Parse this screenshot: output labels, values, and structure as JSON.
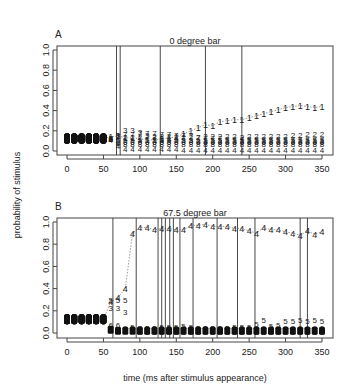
{
  "figure": {
    "ylabel": "probability of stimulus",
    "xlabel": "time (ms after stimulus appearance)"
  },
  "panels": [
    {
      "letter": "A",
      "title": "0 degree bar"
    },
    {
      "letter": "B",
      "title": "67.5 degree bar"
    }
  ],
  "chart_data": [
    {
      "type": "scatter",
      "panel": "A",
      "title": "0 degree bar",
      "xlabel": "time (ms after stimulus appearance)",
      "ylabel": "probability of stimulus",
      "xlim": [
        -10,
        360
      ],
      "ylim": [
        0,
        1.0
      ],
      "xticks": [
        0,
        50,
        100,
        150,
        200,
        250,
        300,
        350
      ],
      "yticks": [
        0.0,
        0.2,
        0.4,
        0.6,
        0.8,
        1.0
      ],
      "vertical_lines_ms": [
        68,
        73,
        128,
        190,
        240
      ],
      "x": [
        0,
        10,
        20,
        30,
        40,
        50,
        60,
        70,
        80,
        90,
        100,
        110,
        120,
        130,
        140,
        150,
        160,
        170,
        180,
        190,
        200,
        210,
        220,
        230,
        240,
        250,
        260,
        270,
        280,
        290,
        300,
        310,
        320,
        330,
        340,
        350
      ],
      "series": [
        {
          "name": "1",
          "values": [
            0.125,
            0.125,
            0.125,
            0.125,
            0.125,
            0.125,
            0.14,
            0.15,
            0.13,
            0.13,
            0.12,
            0.11,
            0.11,
            0.12,
            0.13,
            0.14,
            0.17,
            0.2,
            0.23,
            0.26,
            0.25,
            0.29,
            0.3,
            0.31,
            0.31,
            0.33,
            0.35,
            0.37,
            0.39,
            0.41,
            0.43,
            0.44,
            0.45,
            0.44,
            0.43,
            0.44
          ]
        },
        {
          "name": "2",
          "values": [
            0.125,
            0.125,
            0.125,
            0.125,
            0.125,
            0.125,
            0.12,
            0.14,
            0.14,
            0.14,
            0.14,
            0.15,
            0.15,
            0.15,
            0.15,
            0.14,
            0.14,
            0.14,
            0.14,
            0.15,
            0.15,
            0.15,
            0.15,
            0.15,
            0.14,
            0.15,
            0.15,
            0.15,
            0.15,
            0.15,
            0.15,
            0.16,
            0.16,
            0.17,
            0.17,
            0.17
          ]
        },
        {
          "name": "3",
          "values": [
            0.125,
            0.125,
            0.125,
            0.125,
            0.125,
            0.125,
            0.13,
            0.16,
            0.21,
            0.21,
            0.19,
            0.16,
            0.14,
            0.13,
            0.12,
            0.12,
            0.11,
            0.11,
            0.1,
            0.1,
            0.1,
            0.1,
            0.1,
            0.1,
            0.1,
            0.1,
            0.1,
            0.1,
            0.1,
            0.1,
            0.1,
            0.1,
            0.1,
            0.1,
            0.1,
            0.1
          ]
        },
        {
          "name": "4",
          "values": [
            0.125,
            0.125,
            0.125,
            0.125,
            0.125,
            0.125,
            0.11,
            0.05,
            0.02,
            0.02,
            0.02,
            0.02,
            0.02,
            0.02,
            0.02,
            0.02,
            0.01,
            0.01,
            0.01,
            0.01,
            0.01,
            0.01,
            0.01,
            0.01,
            0.01,
            0.01,
            0.01,
            0.01,
            0.01,
            0.01,
            0.01,
            0.01,
            0.01,
            0.01,
            0.01,
            0.01
          ]
        },
        {
          "name": "5",
          "values": [
            0.125,
            0.125,
            0.125,
            0.125,
            0.125,
            0.125,
            0.12,
            0.11,
            0.11,
            0.11,
            0.11,
            0.11,
            0.11,
            0.11,
            0.11,
            0.11,
            0.11,
            0.11,
            0.11,
            0.11,
            0.11,
            0.11,
            0.11,
            0.11,
            0.11,
            0.11,
            0.11,
            0.11,
            0.11,
            0.11,
            0.11,
            0.11,
            0.11,
            0.11,
            0.11,
            0.11
          ]
        },
        {
          "name": "6",
          "values": [
            0.125,
            0.125,
            0.125,
            0.125,
            0.125,
            0.125,
            0.12,
            0.09,
            0.09,
            0.09,
            0.09,
            0.09,
            0.09,
            0.09,
            0.09,
            0.09,
            0.09,
            0.09,
            0.09,
            0.09,
            0.09,
            0.09,
            0.09,
            0.09,
            0.09,
            0.09,
            0.09,
            0.09,
            0.09,
            0.09,
            0.09,
            0.09,
            0.09,
            0.09,
            0.09,
            0.09
          ]
        },
        {
          "name": "7",
          "values": [
            0.125,
            0.125,
            0.125,
            0.125,
            0.125,
            0.125,
            0.13,
            0.15,
            0.17,
            0.17,
            0.18,
            0.18,
            0.18,
            0.17,
            0.17,
            0.16,
            0.16,
            0.15,
            0.14,
            0.13,
            0.13,
            0.13,
            0.12,
            0.12,
            0.12,
            0.12,
            0.12,
            0.12,
            0.12,
            0.12,
            0.12,
            0.12,
            0.12,
            0.12,
            0.12,
            0.12
          ]
        },
        {
          "name": "8",
          "values": [
            0.125,
            0.125,
            0.125,
            0.125,
            0.125,
            0.125,
            0.12,
            0.08,
            0.07,
            0.07,
            0.07,
            0.07,
            0.07,
            0.07,
            0.07,
            0.07,
            0.07,
            0.07,
            0.07,
            0.07,
            0.07,
            0.07,
            0.07,
            0.07,
            0.07,
            0.07,
            0.07,
            0.07,
            0.07,
            0.07,
            0.07,
            0.07,
            0.07,
            0.07,
            0.07,
            0.07
          ]
        }
      ]
    },
    {
      "type": "scatter",
      "panel": "B",
      "title": "67.5 degree bar",
      "xlabel": "time (ms after stimulus appearance)",
      "ylabel": "probability of stimulus",
      "xlim": [
        -10,
        360
      ],
      "ylim": [
        0,
        1.0
      ],
      "xticks": [
        0,
        50,
        100,
        150,
        200,
        250,
        300,
        350
      ],
      "yticks": [
        0.0,
        0.2,
        0.4,
        0.6,
        0.8,
        1.0
      ],
      "vertical_lines_ms": [
        63,
        95,
        125,
        130,
        135,
        141,
        146,
        155,
        173,
        206,
        234,
        258,
        320,
        330
      ],
      "x": [
        0,
        10,
        20,
        30,
        40,
        50,
        60,
        70,
        80,
        90,
        100,
        110,
        120,
        130,
        140,
        150,
        160,
        170,
        180,
        190,
        200,
        210,
        220,
        230,
        240,
        250,
        260,
        270,
        280,
        290,
        300,
        310,
        320,
        330,
        340,
        350
      ],
      "series": [
        {
          "name": "4",
          "values": [
            0.125,
            0.125,
            0.125,
            0.125,
            0.125,
            0.125,
            0.28,
            0.32,
            0.4,
            0.9,
            0.95,
            0.95,
            0.93,
            0.94,
            0.94,
            0.93,
            0.93,
            0.97,
            0.97,
            0.98,
            0.96,
            0.96,
            0.96,
            0.94,
            0.94,
            0.92,
            0.9,
            0.95,
            0.93,
            0.93,
            0.91,
            0.9,
            0.88,
            0.92,
            0.89,
            0.91
          ]
        },
        {
          "name": "3",
          "values": [
            0.125,
            0.125,
            0.125,
            0.125,
            0.125,
            0.125,
            0.23,
            0.23,
            0.19,
            0.03,
            0.01,
            0.01,
            0.01,
            0.01,
            0.01,
            0.01,
            0.01,
            0.01,
            0.01,
            0.01,
            0.01,
            0.01,
            0.01,
            0.01,
            0.01,
            0.01,
            0.01,
            0.01,
            0.01,
            0.01,
            0.01,
            0.01,
            0.01,
            0.01,
            0.01,
            0.01
          ]
        },
        {
          "name": "5",
          "values": [
            0.125,
            0.125,
            0.125,
            0.125,
            0.125,
            0.125,
            0.3,
            0.3,
            0.3,
            0.06,
            0.05,
            0.05,
            0.05,
            0.06,
            0.06,
            0.06,
            0.07,
            0.06,
            0.05,
            0.05,
            0.05,
            0.05,
            0.05,
            0.06,
            0.06,
            0.06,
            0.09,
            0.12,
            0.07,
            0.08,
            0.11,
            0.11,
            0.12,
            0.11,
            0.12,
            0.11
          ]
        },
        {
          "name": "6",
          "values": [
            0.125,
            0.125,
            0.125,
            0.125,
            0.125,
            0.125,
            0.08,
            0.08,
            0.05,
            0.05,
            0.05,
            0.05,
            0.05,
            0.05,
            0.05,
            0.05,
            0.05,
            0.05,
            0.05,
            0.05,
            0.05,
            0.05,
            0.05,
            0.05,
            0.05,
            0.05,
            0.05,
            0.05,
            0.05,
            0.05,
            0.05,
            0.05,
            0.05,
            0.05,
            0.05,
            0.05
          ]
        },
        {
          "name": "others",
          "values": [
            0.125,
            0.125,
            0.125,
            0.125,
            0.125,
            0.125,
            0.03,
            0.02,
            0.02,
            0.02,
            0.02,
            0.02,
            0.02,
            0.02,
            0.02,
            0.02,
            0.02,
            0.02,
            0.02,
            0.02,
            0.02,
            0.02,
            0.02,
            0.02,
            0.02,
            0.02,
            0.02,
            0.02,
            0.02,
            0.02,
            0.02,
            0.02,
            0.02,
            0.02,
            0.02,
            0.02
          ]
        }
      ]
    }
  ]
}
